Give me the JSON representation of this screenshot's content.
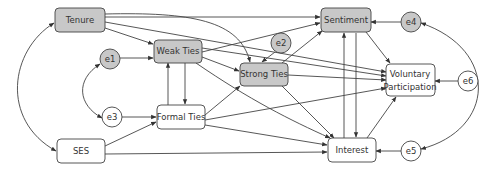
{
  "diagram": {
    "title": "",
    "type": "structural equation path diagram",
    "colors": {
      "latent_fill": "#c8c8c8",
      "observed_fill": "#ffffff",
      "stroke": "#333333",
      "text": "#333333"
    },
    "nodes": [
      {
        "id": "tenure",
        "label": "Tenure",
        "shape": "rounded-rect",
        "filled": true
      },
      {
        "id": "weak_ties",
        "label": "Weak Ties",
        "shape": "rounded-rect",
        "filled": true
      },
      {
        "id": "strong_ties",
        "label": "Strong Ties",
        "shape": "rounded-rect",
        "filled": true
      },
      {
        "id": "sentiment",
        "label": "Sentiment",
        "shape": "rounded-rect",
        "filled": true
      },
      {
        "id": "voluntary",
        "label_line1": "Voluntary",
        "label_line2": "Participation",
        "shape": "rounded-rect",
        "filled": false
      },
      {
        "id": "interest",
        "label": "Interest",
        "shape": "rounded-rect",
        "filled": false
      },
      {
        "id": "formal_ties",
        "label": "Formal Ties",
        "shape": "rounded-rect",
        "filled": false
      },
      {
        "id": "ses",
        "label": "SES",
        "shape": "rounded-rect",
        "filled": false
      }
    ],
    "errors": [
      {
        "id": "e1",
        "label": "e1",
        "filled": true,
        "points_to": "weak_ties"
      },
      {
        "id": "e2",
        "label": "e2",
        "filled": true,
        "points_to": "strong_ties"
      },
      {
        "id": "e3",
        "label": "e3",
        "filled": false,
        "points_to": "formal_ties"
      },
      {
        "id": "e4",
        "label": "e4",
        "filled": true,
        "points_to": "sentiment"
      },
      {
        "id": "e5",
        "label": "e5",
        "filled": false,
        "points_to": "interest"
      },
      {
        "id": "e6",
        "label": "e6",
        "filled": false,
        "points_to": "voluntary"
      }
    ],
    "edges": [
      [
        "Tenure",
        "Weak Ties"
      ],
      [
        "Tenure",
        "Strong Ties"
      ],
      [
        "Tenure",
        "Sentiment"
      ],
      [
        "Tenure",
        "Voluntary Participation"
      ],
      [
        "Weak Ties",
        "Formal Ties"
      ],
      [
        "Formal Ties",
        "Weak Ties"
      ],
      [
        "Weak Ties",
        "Strong Ties"
      ],
      [
        "Weak Ties",
        "Sentiment"
      ],
      [
        "Weak Ties",
        "Voluntary Participation"
      ],
      [
        "Weak Ties",
        "Interest"
      ],
      [
        "Formal Ties",
        "Strong Ties"
      ],
      [
        "Formal Ties",
        "Voluntary Participation"
      ],
      [
        "Formal Ties",
        "Interest"
      ],
      [
        "Strong Ties",
        "Sentiment"
      ],
      [
        "Strong Ties",
        "Voluntary Participation"
      ],
      [
        "Strong Ties",
        "Interest"
      ],
      [
        "Sentiment",
        "Interest"
      ],
      [
        "Interest",
        "Sentiment"
      ],
      [
        "Sentiment",
        "Voluntary Participation"
      ],
      [
        "Interest",
        "Voluntary Participation"
      ],
      [
        "SES",
        "Formal Ties"
      ],
      [
        "SES",
        "Interest"
      ]
    ],
    "covariances": [
      [
        "Tenure",
        "SES"
      ],
      [
        "e1",
        "e3"
      ],
      [
        "e4",
        "e5"
      ]
    ]
  }
}
